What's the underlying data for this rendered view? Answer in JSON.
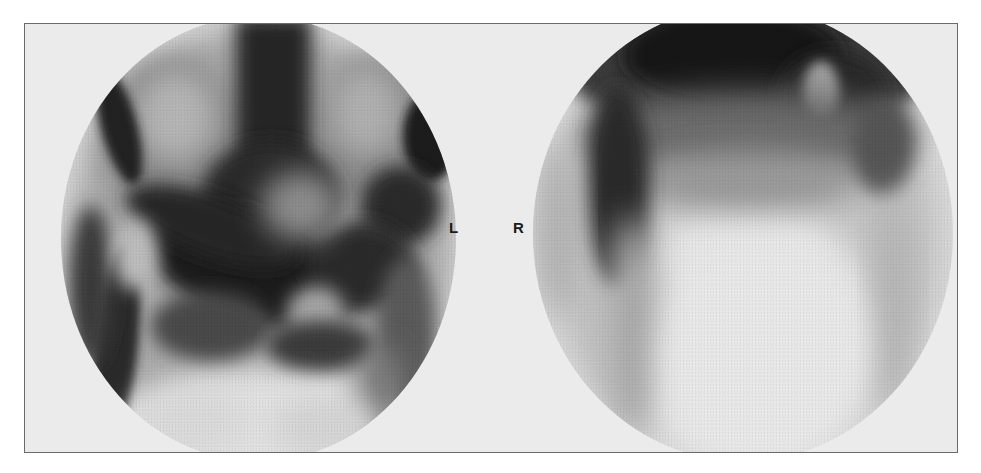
{
  "figure": {
    "type": "bone-scintigram",
    "views": [
      {
        "id": "left-view",
        "description": "anterior pelvis view"
      },
      {
        "id": "right-view",
        "description": "posterior pelvis view"
      }
    ],
    "markers": {
      "left": "L",
      "right": "R"
    },
    "colors": {
      "background": "#ebebeb",
      "uptake_dark": "#1e1e1e",
      "frame_border": "#6a6a6a"
    }
  }
}
